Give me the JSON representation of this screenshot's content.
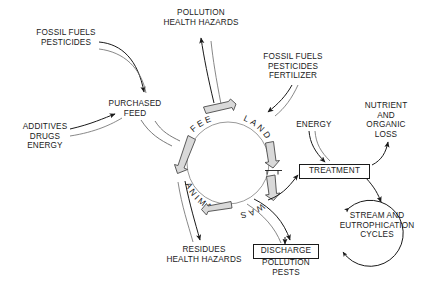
{
  "diagram": {
    "background_color": "#ffffff",
    "ink_color": "#1a1a1a",
    "block_fill_color": "#d9d9d9",
    "cycle": {
      "name": "central-cycle-ring",
      "segments": [
        "FEED",
        "LAND",
        "WASTE",
        "ANIMALS"
      ],
      "direction": "clockwise",
      "center": {
        "x": 228,
        "y": 163
      },
      "radius": 41
    },
    "inputs": [
      {
        "id": "fossil-fuels-pesticides",
        "lines": "FOSSIL FUELS\nPESTICIDES",
        "target": "PURCHASED FEED"
      },
      {
        "id": "additives-drugs-energy",
        "lines": "ADDITIVES\nDRUGS\nENERGY",
        "target": "PURCHASED FEED"
      },
      {
        "id": "fossil-fuels-pesticides-fertilizer",
        "lines": "FOSSIL FUELS\nPESTICIDES\nFERTILIZER",
        "target": "LAND"
      },
      {
        "id": "energy",
        "lines": "ENERGY",
        "target": "TREATMENT"
      }
    ],
    "outputs": [
      {
        "id": "pollution-health-hazards",
        "lines": "POLLUTION\nHEALTH HAZARDS",
        "source": "FEED"
      },
      {
        "id": "residues-health-hazards",
        "lines": "RESIDUES\nHEALTH HAZARDS",
        "source": "ANIMALS"
      },
      {
        "id": "nutrient-and-organic-loss",
        "lines": "NUTRIENT\nAND\nORGANIC\nLOSS",
        "source": "TREATMENT"
      }
    ],
    "nodes": [
      {
        "id": "purchased-feed",
        "lines": "PURCHASED\nFEED",
        "boxed": false
      },
      {
        "id": "treatment",
        "label": "TREATMENT",
        "boxed": true
      },
      {
        "id": "discharge",
        "label": "DISCHARGE",
        "boxed": true
      },
      {
        "id": "discharge-sub",
        "lines": "POLLUTION\nPESTS",
        "boxed": false
      },
      {
        "id": "stream-and-eutrophication-cycles",
        "lines": "STREAM AND\nEUTROPHICATION\nCYCLES",
        "boxed": false,
        "has_circular_arrow": true
      }
    ]
  },
  "labels": {
    "fossil_fuels_pesticides": "FOSSIL FUELS\nPESTICIDES",
    "pollution_health_hazards": "POLLUTION\nHEALTH HAZARDS",
    "fossil_fuels_pesticides_fertilizer": "FOSSIL FUELS\nPESTICIDES\nFERTILIZER",
    "additives_drugs_energy": "ADDITIVES\nDRUGS\nENERGY",
    "purchased_feed": "PURCHASED\nFEED",
    "energy": "ENERGY",
    "nutrient_and_organic_loss": "NUTRIENT\nAND\nORGANIC\nLOSS",
    "treatment": "TREATMENT",
    "stream_and_eutrophication_cycles": "STREAM AND\nEUTROPHICATION\nCYCLES",
    "residues_health_hazards": "RESIDUES\nHEALTH HAZARDS",
    "discharge": "DISCHARGE",
    "pollution_pests": "POLLUTION\nPESTS",
    "ring_feed": "FEED",
    "ring_land": "LAND",
    "ring_waste": "WASTE",
    "ring_animals": "ANIMALS"
  }
}
